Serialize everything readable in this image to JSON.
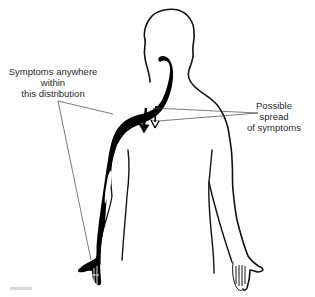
{
  "figure": {
    "type": "anatomical-diagram",
    "colors": {
      "outline": "#111111",
      "distribution_fill": "#000000",
      "leader_line": "#444444",
      "label_text": "#2a2a2a",
      "background": "#ffffff"
    }
  },
  "labels": {
    "distribution": {
      "lines": [
        "Symptoms anywhere",
        "within",
        "this distribution"
      ]
    },
    "spread": {
      "lines": [
        "Possible",
        "spread",
        "of symptoms"
      ]
    }
  },
  "arrows": {
    "count": 2,
    "direction": "downward",
    "meaning": "possible spread of symptoms"
  }
}
